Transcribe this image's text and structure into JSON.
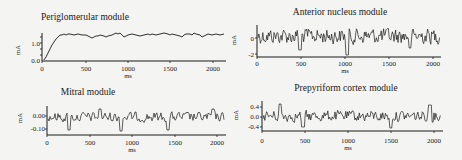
{
  "figure": {
    "background": "#f4f4f2",
    "ink": "#1a1a1a"
  },
  "chart_data": [
    {
      "id": "periglomerular",
      "type": "line",
      "title": "Periglomerular module",
      "xlabel": "ms",
      "ylabel": "mA",
      "xlim": [
        0,
        2100
      ],
      "ylim": [
        0.0,
        1.5
      ],
      "xticks": [
        0,
        500,
        1000,
        1500,
        2000
      ],
      "xtick_labels": [
        "0",
        "500",
        "1000",
        "1500",
        "2000"
      ],
      "yticks": [
        0.0,
        1.0
      ],
      "ytick_labels": [
        "0.0",
        "1.0"
      ],
      "grid": false,
      "description": "Rises from 0 to ~1.4 within first ~200 ms, then fluctuates slowly around 1.3-1.5",
      "x": [
        0,
        50,
        100,
        150,
        200,
        250,
        300,
        400,
        500,
        550,
        600,
        700,
        800,
        900,
        950,
        1000,
        1100,
        1200,
        1300,
        1400,
        1450,
        1500,
        1600,
        1700,
        1800,
        1850,
        1900,
        1950,
        2000,
        2100
      ],
      "values": [
        0.0,
        0.3,
        0.8,
        1.2,
        1.4,
        1.45,
        1.42,
        1.45,
        1.38,
        1.3,
        1.2,
        1.35,
        1.4,
        1.5,
        1.45,
        1.3,
        1.42,
        1.38,
        1.45,
        1.5,
        1.48,
        1.4,
        1.35,
        1.42,
        1.48,
        1.45,
        1.3,
        1.35,
        1.42,
        1.38
      ]
    },
    {
      "id": "anterior-nucleus",
      "type": "line",
      "title": "Anterior nucleus module",
      "xlabel": "ms",
      "ylabel": "mA",
      "xlim": [
        0,
        2100
      ],
      "ylim": [
        -2.5,
        1.5
      ],
      "xticks": [
        0,
        500,
        1000,
        1500,
        2000
      ],
      "xtick_labels": [
        "0",
        "500",
        "1000",
        "1500",
        "2000"
      ],
      "yticks": [
        0,
        -2
      ],
      "ytick_labels": [
        "0",
        "-2"
      ],
      "grid": false,
      "description": "Dense high-frequency noise between about -2 and +1.2, centered near 0"
    },
    {
      "id": "mitral",
      "type": "line",
      "title": "Mitral module",
      "xlabel": "ms",
      "ylabel": "mA",
      "xlim": [
        0,
        2100
      ],
      "ylim": [
        -0.15,
        0.05
      ],
      "xticks": [
        0,
        500,
        1000,
        1500,
        2000
      ],
      "xtick_labels": [
        "0",
        "500",
        "1000",
        "1500",
        "2000"
      ],
      "yticks": [
        0.0,
        -0.1
      ],
      "ytick_labels": [
        "0.00",
        "-0.10"
      ],
      "grid": false,
      "description": "Irregular noisy signal around 0.00 with negative dips to about -0.12 near 230, 870, 1430 ms"
    },
    {
      "id": "prepyriform-cortex",
      "type": "line",
      "title": "Prepyriform cortex module",
      "xlabel": "ms",
      "ylabel": "mA",
      "xlim": [
        0,
        2100
      ],
      "ylim": [
        -0.5,
        0.6
      ],
      "xticks": [
        0,
        500,
        1000,
        1500,
        2000
      ],
      "xtick_labels": [
        "0",
        "500",
        "1000",
        "1500",
        "2000"
      ],
      "yticks": [
        0.4,
        0.0,
        -0.4
      ],
      "ytick_labels": [
        "0.4",
        "0.0",
        "-0.4"
      ],
      "grid": false,
      "description": "High-frequency oscillation around 0.0 with amplitude about ±0.3, occasional spikes to ±0.5"
    }
  ]
}
